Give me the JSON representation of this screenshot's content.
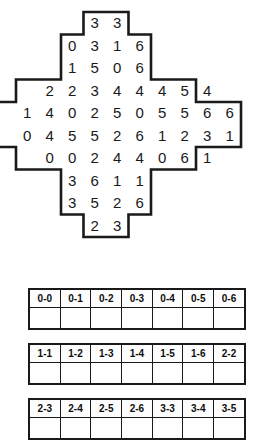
{
  "puzzle": {
    "type": "domino-grid",
    "columns": 10,
    "rows": 10,
    "outline_color": "#1a1a1a",
    "fill_color": "#ffffff",
    "digit_color": "#1a1a1a",
    "grid_rows": [
      {
        "start_col": 3,
        "digits": [
          "3",
          "3"
        ]
      },
      {
        "start_col": 2,
        "digits": [
          "0",
          "3",
          "1",
          "6"
        ]
      },
      {
        "start_col": 2,
        "digits": [
          "1",
          "5",
          "0",
          "6"
        ]
      },
      {
        "start_col": 1,
        "digits": [
          "2",
          "2",
          "3",
          "4",
          "4",
          "4",
          "5",
          "4"
        ]
      },
      {
        "start_col": 0,
        "digits": [
          "1",
          "4",
          "0",
          "2",
          "5",
          "0",
          "5",
          "5",
          "6",
          "6"
        ]
      },
      {
        "start_col": 0,
        "digits": [
          "0",
          "4",
          "5",
          "5",
          "2",
          "6",
          "1",
          "2",
          "3",
          "1"
        ]
      },
      {
        "start_col": 1,
        "digits": [
          "0",
          "0",
          "2",
          "4",
          "4",
          "0",
          "6",
          "1"
        ]
      },
      {
        "start_col": 2,
        "digits": [
          "3",
          "6",
          "1",
          "1"
        ]
      },
      {
        "start_col": 2,
        "digits": [
          "3",
          "5",
          "2",
          "6"
        ]
      },
      {
        "start_col": 3,
        "digits": [
          "2",
          "3"
        ]
      }
    ]
  },
  "domino_tables": [
    {
      "name": "domino-checklist-row-1",
      "labels": [
        "0-0",
        "0-1",
        "0-2",
        "0-3",
        "0-4",
        "0-5",
        "0-6"
      ],
      "checks": [
        "",
        "",
        "",
        "",
        "",
        "",
        ""
      ]
    },
    {
      "name": "domino-checklist-row-2",
      "labels": [
        "1-1",
        "1-2",
        "1-3",
        "1-4",
        "1-5",
        "1-6",
        "2-2"
      ],
      "checks": [
        "",
        "",
        "",
        "",
        "",
        "",
        ""
      ]
    },
    {
      "name": "domino-checklist-row-3",
      "labels": [
        "2-3",
        "2-4",
        "2-5",
        "2-6",
        "3-3",
        "3-4",
        "3-5"
      ],
      "checks": [
        "",
        "",
        "",
        "",
        "",
        "",
        ""
      ]
    }
  ]
}
